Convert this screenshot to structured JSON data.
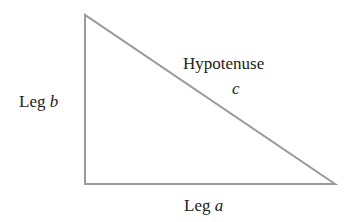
{
  "diagram": {
    "labels": {
      "leg_b": {
        "text": "Leg ",
        "var": "b"
      },
      "hypotenuse": {
        "text": "Hypotenuse",
        "var": "c"
      },
      "leg_a": {
        "text": "Leg ",
        "var": "a"
      }
    },
    "stroke_color": "#9a9a9a"
  }
}
